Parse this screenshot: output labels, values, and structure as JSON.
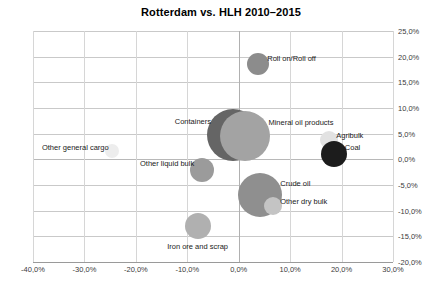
{
  "chart_data": {
    "type": "scatter",
    "title": "Rotterdam vs. HLH 2010–2015",
    "xlabel": "",
    "ylabel": "",
    "xlim": [
      -40,
      30
    ],
    "ylim": [
      -20,
      25
    ],
    "grid": true,
    "legend": "none",
    "x_ticks": [
      "-40,0%",
      "-30,0%",
      "-20,0%",
      "-10,0%",
      "0,0%",
      "10,0%",
      "20,0%",
      "30,0%"
    ],
    "x_tick_values": [
      -40,
      -30,
      -20,
      -10,
      0,
      10,
      20,
      30
    ],
    "y_ticks": [
      "25,0%",
      "20,0%",
      "15,0%",
      "10,0%",
      "5,0%",
      "0,0%",
      "-5,0%",
      "-10,0%",
      "-15,0%",
      "-20,0%"
    ],
    "y_tick_values": [
      25,
      20,
      15,
      10,
      5,
      0,
      -5,
      -10,
      -15,
      -20
    ],
    "points": [
      {
        "label": "Roll on/Roll off",
        "x": 3.8,
        "y": 18.5,
        "size": 11,
        "color": "#8c8c8c",
        "label_side": "right"
      },
      {
        "label": "Containers",
        "x": -1.1,
        "y": 4.7,
        "size": 26,
        "color": "#656565",
        "label_side": "left"
      },
      {
        "label": "Mineral oil products",
        "x": 1.3,
        "y": 4.5,
        "size": 25,
        "color": "#a3a3a3",
        "label_side": "right"
      },
      {
        "label": "Agribulk",
        "x": 17.6,
        "y": 3.7,
        "size": 9,
        "color": "#e2e2e2",
        "label_side": "right"
      },
      {
        "label": "Coal",
        "x": 18.5,
        "y": 1.0,
        "size": 13,
        "color": "#1c1c1c",
        "label_side": "right"
      },
      {
        "label": "Other general cargo",
        "x": -24.7,
        "y": 1.6,
        "size": 7,
        "color": "#ededed",
        "label_side": "left"
      },
      {
        "label": "Other liquid bulk",
        "x": -7.1,
        "y": -2.0,
        "size": 12,
        "color": "#9b9b9b",
        "label_side": "left"
      },
      {
        "label": "Crude oil",
        "x": 4.2,
        "y": -7.0,
        "size": 22,
        "color": "#8f8f8f",
        "label_side": "right"
      },
      {
        "label": "Other dry bulk",
        "x": 6.7,
        "y": -9.1,
        "size": 9,
        "color": "#c4c4c4",
        "label_side": "right"
      },
      {
        "label": "Iron ore and scrap",
        "x": -8.0,
        "y": -13.0,
        "size": 13,
        "color": "#b0b0b0",
        "label_side": "below"
      }
    ]
  }
}
